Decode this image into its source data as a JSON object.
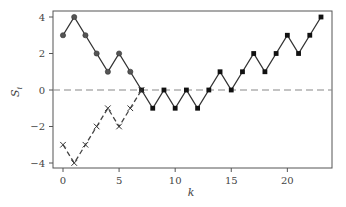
{
  "chart_data": {
    "type": "line",
    "title": "",
    "xlabel": "k",
    "ylabel": "S_i",
    "xlim": [
      -1,
      24
    ],
    "ylim": [
      -4.3,
      4.3
    ],
    "xticks": [
      0,
      5,
      10,
      15,
      20
    ],
    "yticks": [
      -4,
      -2,
      0,
      2,
      4
    ],
    "xtick_labels": [
      "0",
      "5",
      "10",
      "15",
      "20"
    ],
    "ytick_labels": [
      "−4",
      "−2",
      "0",
      "2",
      "4"
    ],
    "grid": false,
    "legend": null,
    "reference_line": {
      "y": 0,
      "style": "dashed",
      "color": "#888888"
    },
    "series": [
      {
        "name": "S (solid, circles k=0–6, squares k=7–23)",
        "style": "solid",
        "color": "#333333",
        "x": [
          0,
          1,
          2,
          3,
          4,
          5,
          6,
          7,
          8,
          9,
          10,
          11,
          12,
          13,
          14,
          15,
          16,
          17,
          18,
          19,
          20,
          21,
          22,
          23
        ],
        "values": [
          3,
          4,
          3,
          2,
          1,
          2,
          1,
          0,
          -1,
          0,
          -1,
          0,
          -1,
          0,
          1,
          0,
          1,
          2,
          1,
          2,
          3,
          2,
          3,
          4
        ],
        "markers": [
          "circle",
          "circle",
          "circle",
          "circle",
          "circle",
          "circle",
          "circle",
          "square",
          "square",
          "square",
          "square",
          "square",
          "square",
          "square",
          "square",
          "square",
          "square",
          "square",
          "square",
          "square",
          "square",
          "square",
          "square",
          "square"
        ]
      },
      {
        "name": "Reflected (dashed, x markers)",
        "style": "dashed",
        "color": "#444444",
        "x": [
          0,
          1,
          2,
          3,
          4,
          5,
          6,
          7
        ],
        "values": [
          -3,
          -4,
          -3,
          -2,
          -1,
          -2,
          -1,
          0
        ],
        "marker": "x"
      }
    ]
  }
}
